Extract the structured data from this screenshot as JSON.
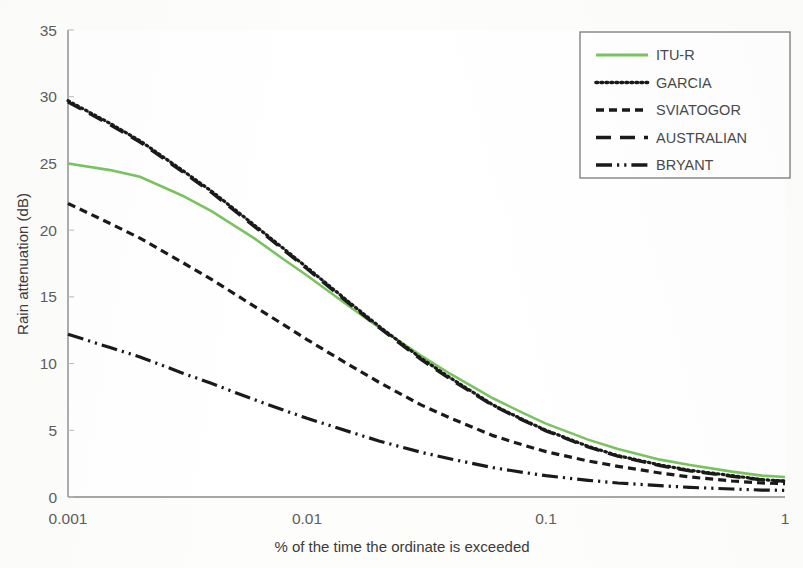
{
  "chart_data": {
    "type": "line",
    "title": "",
    "xlabel": "% of the time the ordinate is exceeded",
    "ylabel": "Rain attenuation (dB)",
    "xscale": "log",
    "xlim": [
      0.001,
      1
    ],
    "ylim": [
      0,
      35
    ],
    "ytick_step": 5,
    "xticks": [
      "0.001",
      "0.01",
      "0.1",
      "1"
    ],
    "xtick_values": [
      0.001,
      0.01,
      0.1,
      1
    ],
    "yticks": [
      "0",
      "5",
      "10",
      "15",
      "20",
      "25",
      "30",
      "35"
    ],
    "ytick_values": [
      0,
      5,
      10,
      15,
      20,
      25,
      30,
      35
    ],
    "grid": false,
    "legend_position": "top-right",
    "x": [
      0.001,
      0.0015,
      0.002,
      0.003,
      0.004,
      0.006,
      0.008,
      0.01,
      0.015,
      0.02,
      0.03,
      0.04,
      0.06,
      0.08,
      0.1,
      0.15,
      0.2,
      0.3,
      0.4,
      0.6,
      0.8,
      1.0
    ],
    "series": [
      {
        "name": "ITU-R",
        "color": "#79C45E",
        "dash": "solid",
        "values": [
          25.0,
          24.5,
          24.0,
          22.6,
          21.4,
          19.4,
          17.8,
          16.6,
          14.3,
          12.7,
          10.6,
          9.2,
          7.4,
          6.3,
          5.5,
          4.3,
          3.6,
          2.8,
          2.4,
          1.9,
          1.6,
          1.5
        ]
      },
      {
        "name": "GARCIA",
        "color": "#1a1a1a",
        "dash": "dotted",
        "values": [
          29.7,
          28.0,
          26.7,
          24.5,
          22.9,
          20.4,
          18.6,
          17.2,
          14.6,
          12.8,
          10.4,
          8.9,
          6.9,
          5.8,
          5.0,
          3.8,
          3.1,
          2.4,
          2.0,
          1.6,
          1.3,
          1.2
        ]
      },
      {
        "name": "SVIATOGOR",
        "color": "#1a1a1a",
        "dash": "dashed",
        "values": [
          22.0,
          20.5,
          19.4,
          17.6,
          16.3,
          14.3,
          12.9,
          11.8,
          9.9,
          8.6,
          6.9,
          5.9,
          4.6,
          3.9,
          3.4,
          2.7,
          2.3,
          1.8,
          1.5,
          1.2,
          1.05,
          1.0
        ]
      },
      {
        "name": "AUSTRALIAN",
        "color": "#1a1a1a",
        "dash": "longdash",
        "values": [
          29.6,
          27.9,
          26.6,
          24.4,
          22.8,
          20.3,
          18.5,
          17.1,
          14.5,
          12.7,
          10.3,
          8.8,
          6.85,
          5.75,
          4.95,
          3.75,
          3.05,
          2.35,
          1.95,
          1.55,
          1.28,
          1.18
        ]
      },
      {
        "name": "BRYANT",
        "color": "#1a1a1a",
        "dash": "dashdotdot",
        "values": [
          12.2,
          11.2,
          10.5,
          9.3,
          8.5,
          7.3,
          6.5,
          5.9,
          4.9,
          4.2,
          3.35,
          2.85,
          2.2,
          1.85,
          1.6,
          1.25,
          1.05,
          0.85,
          0.72,
          0.6,
          0.52,
          0.5
        ]
      }
    ]
  },
  "legend": {
    "items": [
      {
        "label": "ITU-R"
      },
      {
        "label": "GARCIA"
      },
      {
        "label": "SVIATOGOR"
      },
      {
        "label": "AUSTRALIAN"
      },
      {
        "label": "BRYANT"
      }
    ]
  },
  "axes": {
    "y_title": "Rain attenuation (dB)",
    "x_title": "% of the time the ordinate is exceeded"
  }
}
